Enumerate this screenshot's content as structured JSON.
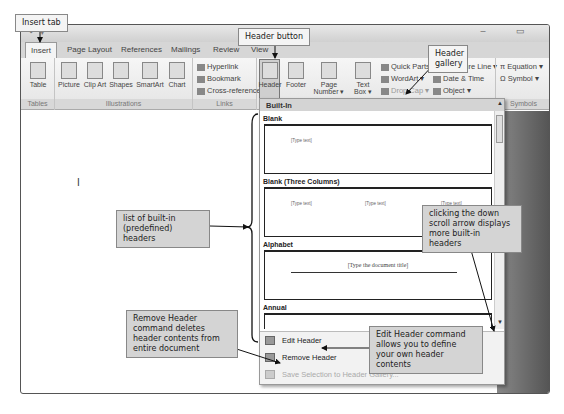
{
  "window": {
    "title": "Docum",
    "quick_access": "↶ ▾",
    "controls": "– ▭"
  },
  "tabs": [
    {
      "label": "Insert",
      "active": true
    },
    {
      "label": "Page Layout"
    },
    {
      "label": "References"
    },
    {
      "label": "Mailings"
    },
    {
      "label": "Review"
    },
    {
      "label": "View"
    }
  ],
  "ribbon": {
    "tables": {
      "label": "Tables",
      "table_btn": "Table"
    },
    "illustrations": {
      "label": "Illustrations",
      "picture": "Picture",
      "clipart": "Clip Art",
      "shapes": "Shapes",
      "smartart": "SmartArt",
      "chart": "Chart"
    },
    "links": {
      "label": "Links",
      "hyperlink": "Hyperlink",
      "bookmark": "Bookmark",
      "crossref": "Cross-reference"
    },
    "headerfooter": {
      "header": "Header",
      "footer": "Footer",
      "pagenumber": "Page Number ▾"
    },
    "text": {
      "textbox": "Text Box ▾",
      "quickparts": "Quick Parts ▾",
      "wordart": "WordArt ▾",
      "dropcap": "Drop Cap ▾",
      "sigline": "Signature Line ▾",
      "datetime": "Date & Time",
      "object": "Object ▾"
    },
    "symbols": {
      "label": "Symbols",
      "equation": "Equation ▾",
      "symbol": "Symbol ▾"
    }
  },
  "gallery": {
    "heading": "Built-In",
    "items": [
      {
        "title": "Blank",
        "placeholders": [
          "[Type text]"
        ]
      },
      {
        "title": "Blank (Three Columns)",
        "placeholders": [
          "[Type text]",
          "[Type text]",
          "[Type text]"
        ]
      },
      {
        "title": "Alphabet",
        "placeholders": [
          "[Type the document title]"
        ]
      },
      {
        "title": "Annual",
        "placeholders": [
          "[Type the document title] | [Year]"
        ]
      }
    ],
    "menu": [
      {
        "label": "Edit Header",
        "enabled": true
      },
      {
        "label": "Remove Header",
        "enabled": true
      },
      {
        "label": "Save Selection to Header Gallery...",
        "enabled": false
      }
    ]
  },
  "callouts": {
    "insert_tab": "Insert tab",
    "header_button": "Header button",
    "header_gallery": "Header gallery",
    "builtin_list": "list of built-in (predefined) headers",
    "scroll_arrow": "clicking the down scroll arrow displays more built-in headers",
    "remove_header": "Remove Header command deletes header contents from entire document",
    "edit_header": "Edit Header command allows you to define your own header contents"
  }
}
